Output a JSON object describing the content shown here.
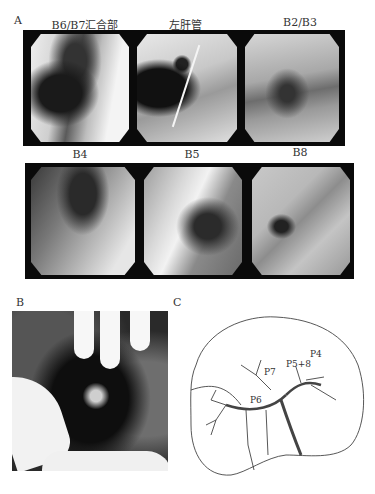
{
  "figure": {
    "panel_a": {
      "label": "A",
      "row1": [
        {
          "title": "B6/B7汇合部"
        },
        {
          "title": "左肝管"
        },
        {
          "title": "B2/B3"
        }
      ],
      "row2": [
        {
          "title": "B4"
        },
        {
          "title": "B5"
        },
        {
          "title": "B8"
        }
      ]
    },
    "panel_b": {
      "label": "B"
    },
    "panel_c": {
      "label": "C",
      "annotations": [
        "P4",
        "P5+8",
        "P7",
        "P6"
      ]
    }
  }
}
